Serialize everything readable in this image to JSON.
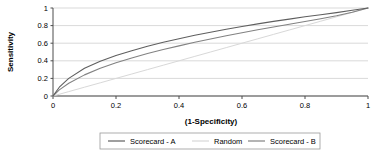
{
  "chart_data": {
    "type": "line",
    "title": "",
    "xlabel": "(1-Specificity)",
    "ylabel": "Sensitivity",
    "xlim": [
      0,
      1
    ],
    "ylim": [
      0,
      1
    ],
    "grid": true,
    "legend_position": "bottom",
    "x_ticks": [
      "0",
      "0.2",
      "0.4",
      "0.6",
      "0.8",
      "1"
    ],
    "x_tick_values": [
      0,
      0.2,
      0.4,
      0.6,
      0.8,
      1
    ],
    "y_ticks": [
      "0",
      "0.2",
      "0.4",
      "0.6",
      "0.8",
      "1"
    ],
    "y_tick_values": [
      0,
      0.2,
      0.4,
      0.6,
      0.8,
      1
    ],
    "x": [
      0,
      0.02,
      0.05,
      0.1,
      0.15,
      0.2,
      0.25,
      0.3,
      0.35,
      0.4,
      0.45,
      0.5,
      0.55,
      0.6,
      0.65,
      0.7,
      0.75,
      0.8,
      0.85,
      0.9,
      0.95,
      1
    ],
    "series": [
      {
        "name": "Scorecard - A",
        "color": "#5f5f5f",
        "width": 1.1,
        "values": [
          0,
          0.1,
          0.2,
          0.315,
          0.395,
          0.46,
          0.515,
          0.565,
          0.61,
          0.65,
          0.69,
          0.725,
          0.758,
          0.79,
          0.82,
          0.848,
          0.874,
          0.9,
          0.924,
          0.948,
          0.974,
          1
        ]
      },
      {
        "name": "Random",
        "color": "#d8d8d8",
        "width": 1.0,
        "values": [
          0,
          0.02,
          0.05,
          0.1,
          0.15,
          0.2,
          0.25,
          0.3,
          0.35,
          0.4,
          0.45,
          0.5,
          0.55,
          0.6,
          0.65,
          0.7,
          0.75,
          0.8,
          0.85,
          0.9,
          0.95,
          1
        ]
      },
      {
        "name": "Scorecard - B",
        "color": "#828282",
        "width": 1.1,
        "values": [
          0,
          0.07,
          0.145,
          0.24,
          0.315,
          0.378,
          0.432,
          0.482,
          0.528,
          0.57,
          0.61,
          0.648,
          0.684,
          0.718,
          0.752,
          0.784,
          0.816,
          0.846,
          0.877,
          0.912,
          0.952,
          1
        ]
      }
    ],
    "legend": [
      {
        "label": "Scorecard - A",
        "color": "#5f5f5f"
      },
      {
        "label": "Random",
        "color": "#d8d8d8"
      },
      {
        "label": "Scorecard - B",
        "color": "#828282"
      }
    ],
    "colors": {
      "grid": "#cfcfcf",
      "axis": "#4d4d4d",
      "legend_border": "#9a9a9a",
      "background": "#ffffff"
    }
  }
}
